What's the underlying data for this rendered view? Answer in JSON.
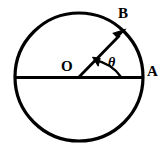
{
  "figure": {
    "type": "geometry-diagram",
    "background_color": "#ffffff",
    "stroke_color": "#000000",
    "labels": {
      "center": "O",
      "point_on_circle_right": "A",
      "point_on_circle_upper_right": "B",
      "angle": "θ"
    },
    "geometry": {
      "circle": {
        "cx": 79,
        "cy": 77,
        "r": 64,
        "stroke_width": 3
      },
      "diameter": {
        "x1": 15,
        "y1": 77,
        "x2": 143,
        "y2": 77,
        "stroke_width": 3
      },
      "radius_vector": {
        "x1": 79,
        "y1": 77,
        "x2": 124,
        "y2": 31,
        "stroke_width": 2.6,
        "arrowhead": "at-B-end"
      },
      "angle_arc": {
        "cx": 79,
        "cy": 77,
        "r": 42,
        "start_deg": 0,
        "end_deg": 45,
        "stroke_width": 2.2,
        "arrowhead": "at-radius-end"
      },
      "angle_degrees": 45
    }
  }
}
